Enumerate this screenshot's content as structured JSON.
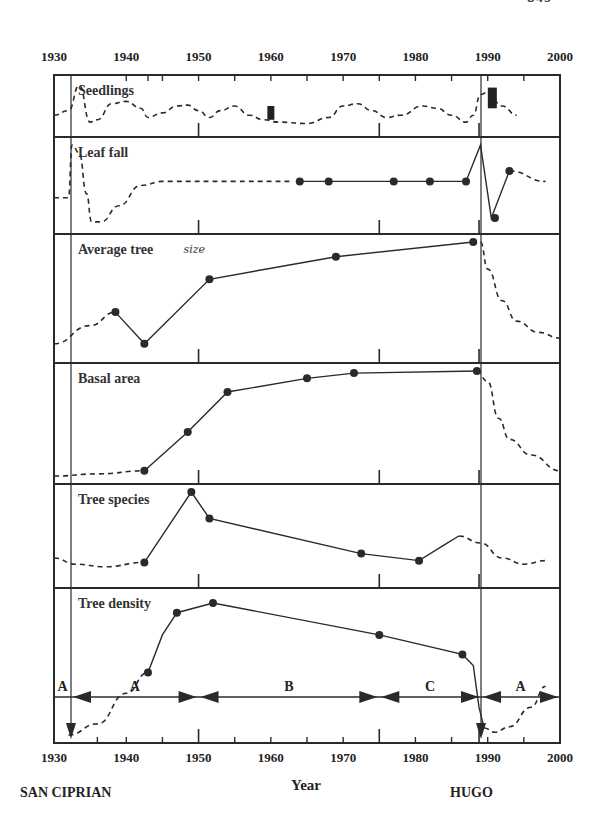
{
  "page": {
    "number": "849"
  },
  "chart_data": {
    "type": "line",
    "title": "",
    "xlabel": "Year",
    "ylabel": "",
    "xlim": [
      1930,
      2000
    ],
    "x_ticks": [
      1930,
      1940,
      1950,
      1960,
      1970,
      1980,
      1990,
      2000
    ],
    "x_tick_labels": [
      "1930",
      "1940",
      "1950",
      "1960",
      "1970",
      "1980",
      "1990",
      "2000"
    ],
    "events": [
      {
        "label": "SAN CIPRIAN",
        "year": 1932
      },
      {
        "label": "HUGO",
        "year": 1989
      }
    ],
    "periods": [
      {
        "label": "A",
        "start": 1930,
        "end": 1932
      },
      {
        "label": "A",
        "start": 1932,
        "end": 1950
      },
      {
        "label": "B",
        "start": 1950,
        "end": 1975
      },
      {
        "label": "C",
        "start": 1975,
        "end": 1989
      },
      {
        "label": "A",
        "start": 1989,
        "end": 2000
      }
    ],
    "panels": [
      {
        "name": "Seedlings",
        "annotation": "",
        "measured_bars": [
          {
            "year": 1960,
            "low": 0.2,
            "high": 0.5
          },
          {
            "year": 1990.5,
            "low": 0.45,
            "high": 0.9
          }
        ],
        "points": [],
        "dashed": [
          [
            1930,
            0.3
          ],
          [
            1932,
            0.4
          ],
          [
            1933.5,
            0.95
          ],
          [
            1935,
            0.15
          ],
          [
            1936,
            0.2
          ],
          [
            1938,
            0.55
          ],
          [
            1940,
            0.6
          ],
          [
            1942,
            0.45
          ],
          [
            1943,
            0.25
          ],
          [
            1945,
            0.35
          ],
          [
            1947,
            0.5
          ],
          [
            1948.5,
            0.52
          ],
          [
            1950,
            0.4
          ],
          [
            1951.5,
            0.25
          ],
          [
            1953,
            0.4
          ],
          [
            1955,
            0.5
          ],
          [
            1957,
            0.3
          ],
          [
            1959,
            0.2
          ],
          [
            1961,
            0.15
          ],
          [
            1965,
            0.12
          ],
          [
            1968,
            0.25
          ],
          [
            1970,
            0.5
          ],
          [
            1972,
            0.55
          ],
          [
            1974,
            0.4
          ],
          [
            1976,
            0.25
          ],
          [
            1978,
            0.3
          ],
          [
            1981,
            0.5
          ],
          [
            1983,
            0.45
          ],
          [
            1985,
            0.3
          ],
          [
            1987,
            0.15
          ],
          [
            1988,
            0.3
          ],
          [
            1989,
            0.75
          ],
          [
            1990,
            0.8
          ],
          [
            1992,
            0.5
          ],
          [
            1994,
            0.3
          ]
        ],
        "solid": []
      },
      {
        "name": "Leaf fall",
        "annotation": "",
        "points": [
          [
            1964,
            0.55
          ],
          [
            1968,
            0.55
          ],
          [
            1977,
            0.55
          ],
          [
            1982,
            0.55
          ],
          [
            1987,
            0.55
          ],
          [
            1991,
            0.1
          ],
          [
            1993,
            0.68
          ]
        ],
        "dashed": [
          [
            1930,
            0.35
          ],
          [
            1932,
            0.35
          ],
          [
            1932.5,
            1.0
          ],
          [
            1933.5,
            0.9
          ],
          [
            1934.5,
            0.4
          ],
          [
            1935.2,
            0.05
          ],
          [
            1936.5,
            0.05
          ],
          [
            1939,
            0.25
          ],
          [
            1942,
            0.5
          ],
          [
            1945,
            0.55
          ],
          [
            1955,
            0.55
          ],
          [
            1963,
            0.55
          ]
        ],
        "solid": [
          [
            1964,
            0.55
          ],
          [
            1968,
            0.55
          ],
          [
            1977,
            0.55
          ],
          [
            1982,
            0.55
          ],
          [
            1987,
            0.55
          ],
          [
            1989,
            1.0
          ],
          [
            1990.5,
            0.1
          ],
          [
            1993,
            0.68
          ]
        ],
        "dashed_after": [
          [
            1993,
            0.68
          ],
          [
            1998,
            0.55
          ]
        ]
      },
      {
        "name": "Average tree",
        "annotation": "size",
        "points": [
          [
            1938.5,
            0.38
          ],
          [
            1942.5,
            0.1
          ],
          [
            1951.5,
            0.67
          ],
          [
            1969,
            0.87
          ],
          [
            1988,
            1.0
          ]
        ],
        "dashed": [
          [
            1930,
            0.1
          ],
          [
            1935,
            0.26
          ],
          [
            1938.5,
            0.38
          ]
        ],
        "solid": [
          [
            1938.5,
            0.38
          ],
          [
            1942.5,
            0.1
          ],
          [
            1951.5,
            0.67
          ],
          [
            1969,
            0.87
          ],
          [
            1988,
            1.0
          ]
        ],
        "dashed_after": [
          [
            1989,
            1.0
          ],
          [
            1990,
            0.76
          ],
          [
            1992,
            0.48
          ],
          [
            1994,
            0.3
          ],
          [
            1997,
            0.2
          ],
          [
            2000,
            0.15
          ]
        ]
      },
      {
        "name": "Basal area",
        "annotation": "",
        "points": [
          [
            1942.5,
            0.05
          ],
          [
            1948.5,
            0.42
          ],
          [
            1954,
            0.8
          ],
          [
            1965,
            0.93
          ],
          [
            1971.5,
            0.98
          ],
          [
            1988.5,
            1.0
          ]
        ],
        "dashed": [
          [
            1930,
            0.0
          ],
          [
            1936,
            0.02
          ],
          [
            1942.5,
            0.05
          ]
        ],
        "solid": [
          [
            1942.5,
            0.05
          ],
          [
            1948.5,
            0.42
          ],
          [
            1954,
            0.8
          ],
          [
            1965,
            0.93
          ],
          [
            1971.5,
            0.98
          ],
          [
            1988.5,
            1.0
          ]
        ],
        "dashed_after": [
          [
            1988.5,
            1.0
          ],
          [
            1990,
            0.9
          ],
          [
            1991.5,
            0.55
          ],
          [
            1993,
            0.35
          ],
          [
            1996,
            0.2
          ],
          [
            2000,
            0.05
          ]
        ]
      },
      {
        "name": "Tree species",
        "annotation": "",
        "points": [
          [
            1942.5,
            0.2
          ],
          [
            1949,
            1.0
          ],
          [
            1951.5,
            0.7
          ],
          [
            1972.5,
            0.3
          ],
          [
            1980.5,
            0.22
          ]
        ],
        "dashed": [
          [
            1930,
            0.25
          ],
          [
            1933,
            0.18
          ],
          [
            1937,
            0.15
          ],
          [
            1942.5,
            0.2
          ]
        ],
        "solid": [
          [
            1942.5,
            0.2
          ],
          [
            1949,
            1.0
          ],
          [
            1951.5,
            0.7
          ],
          [
            1972.5,
            0.3
          ],
          [
            1980.5,
            0.22
          ],
          [
            1984,
            0.4
          ],
          [
            1986,
            0.5
          ]
        ],
        "dashed_after": [
          [
            1986,
            0.5
          ],
          [
            1989,
            0.42
          ],
          [
            1992,
            0.25
          ],
          [
            1995,
            0.18
          ],
          [
            1998,
            0.22
          ]
        ]
      },
      {
        "name": "Tree density",
        "annotation": "",
        "points": [
          [
            1943,
            0.45
          ],
          [
            1947,
            0.88
          ],
          [
            1952,
            0.95
          ],
          [
            1975,
            0.72
          ],
          [
            1986.5,
            0.58
          ]
        ],
        "dashed": [
          [
            1932,
            0.0
          ],
          [
            1936,
            0.08
          ],
          [
            1940,
            0.3
          ],
          [
            1943,
            0.45
          ]
        ],
        "solid": [
          [
            1943,
            0.45
          ],
          [
            1945,
            0.72
          ],
          [
            1947,
            0.88
          ],
          [
            1952,
            0.95
          ],
          [
            1975,
            0.72
          ],
          [
            1986.5,
            0.58
          ],
          [
            1988,
            0.5
          ],
          [
            1988.8,
            0.2
          ],
          [
            1989.5,
            0.05
          ]
        ],
        "dashed_after": [
          [
            1989.5,
            0.05
          ],
          [
            1991,
            0.02
          ],
          [
            1993,
            0.06
          ],
          [
            1996,
            0.2
          ],
          [
            1998,
            0.35
          ]
        ]
      }
    ]
  }
}
